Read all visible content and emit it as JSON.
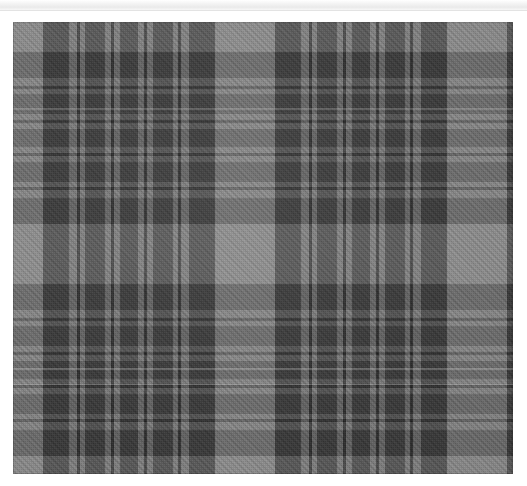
{
  "page": {
    "background_color": "#ffffff"
  },
  "chrome_strip": {
    "name": "cropped-window-chrome",
    "visible": true,
    "height_px": 10,
    "color": "#eaeaea",
    "label": ""
  },
  "swatch": {
    "label": "",
    "alt_text": "Grey and charcoal tartan plaid woven fabric swatch",
    "x": 13,
    "y": 22,
    "width": 500,
    "height": 452,
    "border_color": "#5d5d5d"
  },
  "palette": {
    "ground_mid_grey": "#7a7a7a",
    "light_grey": "#8d8d8d",
    "mid_grey": "#6e6e6e",
    "dark_charcoal": "#3a3a3a",
    "deep_black": "#262626",
    "accent_hairline": "#b0b0b0",
    "white_ffffff": "#ffffff"
  },
  "tartan": {
    "type": "sett",
    "symmetry": "symmetric",
    "repeat_px": {
      "warp": 125,
      "weft": 123
    },
    "warp_sequence": [
      {
        "color": "#8d8d8d",
        "width": 30,
        "name": "light-ground"
      },
      {
        "color": "#3a3a3a",
        "width": 26,
        "name": "charcoal-block"
      },
      {
        "color": "#7a7a7a",
        "width": 8,
        "name": "mid-gap"
      },
      {
        "color": "#262626",
        "width": 3,
        "name": "black-hairline"
      },
      {
        "color": "#7a7a7a",
        "width": 5,
        "name": "mid-gap"
      },
      {
        "color": "#3a3a3a",
        "width": 20,
        "name": "charcoal-block"
      },
      {
        "color": "#7a7a7a",
        "width": 6,
        "name": "mid-gap"
      },
      {
        "color": "#262626",
        "width": 3,
        "name": "black-hairline"
      },
      {
        "color": "#7a7a7a",
        "width": 6,
        "name": "mid-gap"
      },
      {
        "color": "#3a3a3a",
        "width": 18,
        "name": "charcoal-block"
      }
    ],
    "weft_sequence": [
      {
        "color": "#8d8d8d",
        "height": 30,
        "name": "light-ground"
      },
      {
        "color": "#3a3a3a",
        "height": 26,
        "name": "charcoal-block"
      },
      {
        "color": "#7a7a7a",
        "height": 8,
        "name": "mid-gap"
      },
      {
        "color": "#262626",
        "height": 3,
        "name": "black-hairline"
      },
      {
        "color": "#7a7a7a",
        "height": 5,
        "name": "mid-gap"
      },
      {
        "color": "#3a3a3a",
        "height": 20,
        "name": "charcoal-block"
      },
      {
        "color": "#7a7a7a",
        "height": 6,
        "name": "mid-gap"
      },
      {
        "color": "#262626",
        "height": 3,
        "name": "black-hairline"
      },
      {
        "color": "#7a7a7a",
        "height": 6,
        "name": "mid-gap"
      },
      {
        "color": "#3a3a3a",
        "height": 18,
        "name": "charcoal-block"
      }
    ],
    "weave": {
      "structure": "2/2 twill",
      "diagonal_degrees": 45,
      "thread_pitch_px": 2
    },
    "sheen_lines": [
      {
        "top_pct": 19.0,
        "height_px": 2,
        "opacity": 0.18
      },
      {
        "top_pct": 76.5,
        "height_px": 2,
        "opacity": 0.22
      },
      {
        "top_pct": 80.0,
        "height_px": 1,
        "opacity": 0.14
      }
    ]
  }
}
